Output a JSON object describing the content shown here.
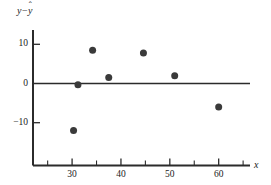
{
  "chart_data": {
    "type": "scatter",
    "title": "",
    "subtitle": "",
    "xlabel": "x",
    "ylabel": "y − ŷ",
    "ylabel_parts": {
      "first": "y",
      "operator": "−",
      "second": "y",
      "second_accent": "ˆ"
    },
    "xlim": [
      22,
      66
    ],
    "ylim": [
      -17,
      13
    ],
    "grid": false,
    "legend": null,
    "x_ticks_major": [
      30,
      40,
      50,
      60
    ],
    "x_tick_labels": [
      "30",
      "40",
      "50",
      "60"
    ],
    "x_ticks_minor": [
      25,
      35,
      45,
      55,
      65
    ],
    "y_ticks_major": [
      10,
      0,
      -10
    ],
    "y_tick_labels": [
      "10",
      "0",
      "−10"
    ],
    "reference_line": {
      "orientation": "horizontal",
      "value": 0
    },
    "points": [
      {
        "x": 30.3,
        "y": -12
      },
      {
        "x": 31.2,
        "y": -0.3
      },
      {
        "x": 34.2,
        "y": 8.5
      },
      {
        "x": 37.5,
        "y": 1.5
      },
      {
        "x": 44.6,
        "y": 7.8
      },
      {
        "x": 51.0,
        "y": 2.0
      },
      {
        "x": 60.0,
        "y": -6.0
      }
    ],
    "marker": {
      "shape": "circle",
      "color": "#3a3a3a",
      "size": 4.6
    },
    "axis_color": "#2b2b2b",
    "background_color": "#ffffff"
  }
}
